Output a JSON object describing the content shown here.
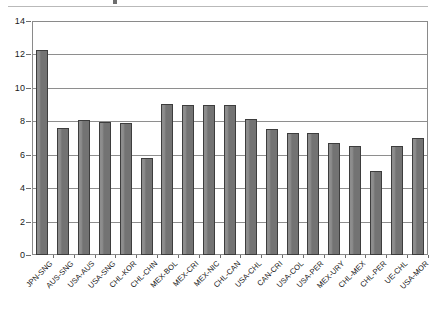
{
  "figure": {
    "top_rule": "header-divider",
    "title_fragment": "cropped-title-descender"
  },
  "chart_data": {
    "type": "bar",
    "title": "",
    "subtitle": "",
    "xlabel": "",
    "ylabel": "",
    "ylim": [
      0,
      14
    ],
    "ytick_values": [
      0,
      2,
      4,
      6,
      8,
      10,
      12,
      14
    ],
    "ytick_labels": [
      "0",
      "2",
      "4",
      "6",
      "8",
      "10",
      "12",
      "14"
    ],
    "grid": "horizontal",
    "legend": "none",
    "bar_color": "#7c7c7c",
    "bar_edge_color": "#3d3d3d",
    "categories": [
      "JPN-SNG",
      "AUS-SNG",
      "USA-AUS",
      "USA-SNG",
      "CHL-KOR",
      "CHL-CHN",
      "MEX-BOL",
      "MEX-CRI",
      "MEX-NIC",
      "CHL-CAN",
      "USA-CHL",
      "CAN-CRI",
      "USA-COL",
      "USA-PER",
      "MEX-URY",
      "CHL-MEX",
      "CHL-PER",
      "UE-CHL",
      "USA-MOR"
    ],
    "values": [
      12.25,
      7.6,
      8.05,
      7.95,
      7.9,
      5.8,
      9.05,
      9.0,
      9.0,
      8.95,
      8.15,
      7.55,
      7.3,
      7.3,
      6.7,
      6.5,
      5.0,
      6.5,
      7.0
    ]
  }
}
